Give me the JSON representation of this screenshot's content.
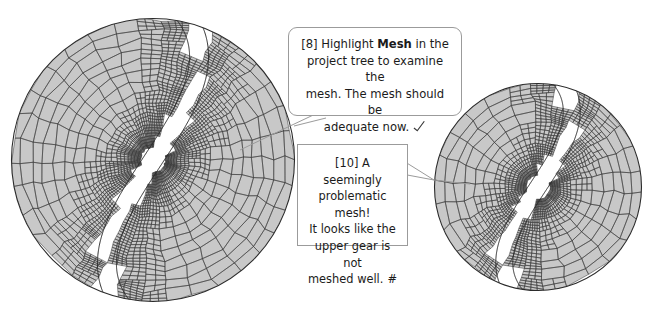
{
  "figure": {
    "kind": "finite-element-mesh-comparison",
    "background_color": "#ffffff",
    "mesh_fill_color": "#c8c8c8",
    "mesh_line_color": "#3c3c3c",
    "outline_color": "#2b2b2b",
    "left_label": "refined gear mesh (circular domain)",
    "right_label": "zoomed gear mesh detail (circular domain)"
  },
  "callouts": [
    {
      "id": "callout-1",
      "shape": "rounded-speech-bubble",
      "tail_direction": "down-left",
      "step": "[8]",
      "line1_pre": "[8] Highlight ",
      "line1_bold": "Mesh",
      "line1_post": " in the",
      "line2": "project tree to examine the",
      "line3": "mesh. The mesh should be",
      "line4": "adequate now.",
      "mark": "check-mark",
      "mark_glyph": "✓",
      "full_text": "[8] Highlight Mesh in the project tree to examine the mesh. The mesh should be adequate now."
    },
    {
      "id": "callout-2",
      "shape": "rectangle-speech-bubble",
      "tail_direction": "right",
      "step": "[10]",
      "line1": "[10] A seemingly",
      "line2": "problematic mesh!",
      "line3": "It looks like the",
      "line4": "upper gear is not",
      "line5_pre": "meshed well.",
      "mark": "hash-mark",
      "mark_glyph": "#",
      "full_text": "[10] A seemingly problematic mesh! It looks like the upper gear is not meshed well. #"
    }
  ],
  "colors": {
    "text": "#1b1b1b",
    "border": "#9b9b9b",
    "mesh_fill": "#c8c8c8",
    "mesh_stroke": "#3c3c3c"
  }
}
